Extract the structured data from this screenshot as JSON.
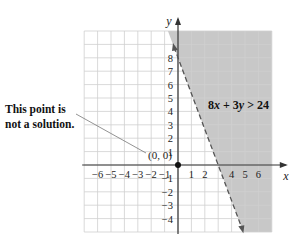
{
  "chart_data": {
    "type": "line",
    "title": "",
    "xlabel": "x",
    "ylabel": "y",
    "xlim": [
      -7,
      7
    ],
    "ylim": [
      -5,
      10
    ],
    "grid": true,
    "x_ticks": [
      -6,
      -5,
      -4,
      -3,
      -2,
      -1,
      1,
      2,
      3,
      4,
      5,
      6
    ],
    "x_tick_labels_shown": [
      "−6",
      "−5",
      "−4",
      "−3",
      "−2",
      "−1",
      "1",
      "2",
      "4",
      "5",
      "6"
    ],
    "y_ticks": [
      -4,
      -3,
      -2,
      -1,
      1,
      2,
      3,
      4,
      5,
      6,
      7,
      8
    ],
    "y_tick_labels_shown": [
      "−4",
      "−3",
      "−2",
      "−1",
      "1",
      "2",
      "3",
      "4",
      "5",
      "6",
      "7",
      "8"
    ],
    "boundary_line": {
      "equation": "8x + 3y = 24",
      "style": "dashed",
      "x_intercept": 3,
      "y_intercept": 8,
      "endpoints": [
        [
          -0.3,
          8.8
        ],
        [
          4.8,
          -4.8
        ]
      ]
    },
    "shaded_region": {
      "inequality": "8x + 3y > 24",
      "side": "right/above line",
      "color": "#c8c8c8"
    },
    "points": [
      {
        "x": 0,
        "y": 0,
        "label": "(0, 0)",
        "filled": true
      }
    ],
    "annotations": [
      {
        "text": "This point is not a solution.",
        "points_to": [
          0,
          0
        ]
      }
    ]
  },
  "labels": {
    "annotation_line1": "This point is",
    "annotation_line2": "not a solution.",
    "origin_label": "(0, 0)",
    "inequality_a": "8",
    "inequality_b": "x",
    "inequality_c": " + 3",
    "inequality_d": "y",
    "inequality_e": " > 24",
    "x_axis_label": "x",
    "y_axis_label": "y"
  },
  "colors": {
    "shade": "#c8c8c8",
    "grid": "#cfcfcf",
    "axis": "#333333",
    "line": "#555555"
  }
}
